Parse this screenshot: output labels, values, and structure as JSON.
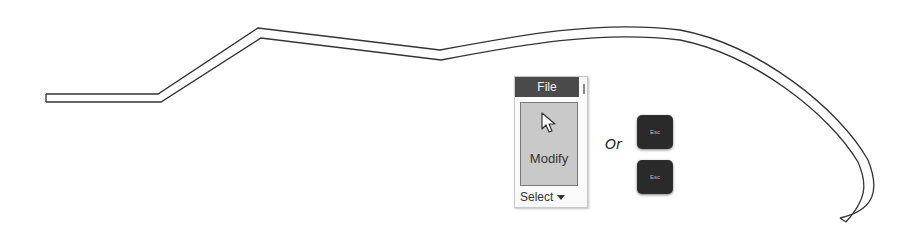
{
  "diagram": {
    "shape": "double-line sketched polyline wall / path",
    "stroke_color": "#333333"
  },
  "ribbon": {
    "tab_label": "File",
    "button_label": "Modify",
    "button_icon": "cursor-arrow-icon",
    "dropdown_label": "Select",
    "dropdown_icon": "caret-down-icon"
  },
  "connector": {
    "text": "Or"
  },
  "keys": [
    {
      "label": "Esc"
    },
    {
      "label": "Esc"
    }
  ]
}
